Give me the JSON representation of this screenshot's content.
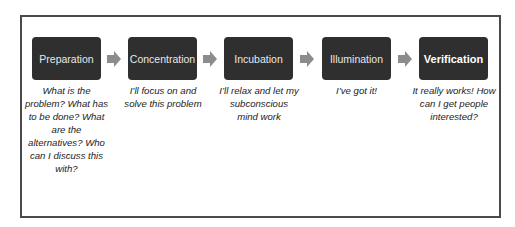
{
  "diagram": {
    "stages": [
      {
        "label": "Preparation",
        "description": "What is the problem? What has to be done? What are the alternatives? Who can I discuss this with?"
      },
      {
        "label": "Concentration",
        "description": "I’ll focus on and solve this problem"
      },
      {
        "label": "Incubation",
        "description": "I’ll relax and let my subconscious mind work"
      },
      {
        "label": "Illumination",
        "description": "I’ve got it!"
      },
      {
        "label": "Verification",
        "description": "It really works! How can I get people interested?"
      }
    ],
    "colors": {
      "box": "#2f2f2f",
      "arrow": "#8c8c8c",
      "frame": "#4a4a4a"
    }
  }
}
